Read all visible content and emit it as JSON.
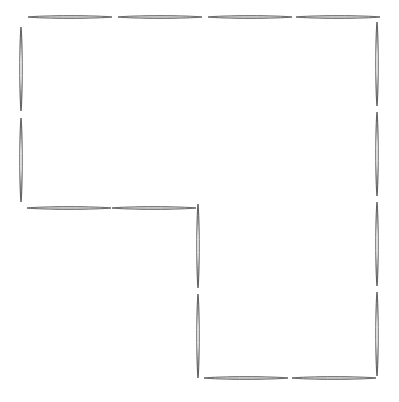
{
  "figure": {
    "background_color": "#ffffff",
    "stick_outline_color": "#4d4d4d",
    "stick_fill_color": "#fdfdfd",
    "stick_highlight_color": "#ffffff",
    "stick_count": 16,
    "shape_description": "L-shaped staircase polygon outlined by matchsticks",
    "canvas": {
      "width": 399,
      "height": 396
    },
    "sticks": [
      {
        "id": "top-1",
        "name": "top-row-stick-1",
        "orientation": "horizontal",
        "x": 28,
        "y": 17,
        "length": 84
      },
      {
        "id": "top-2",
        "name": "top-row-stick-2",
        "orientation": "horizontal",
        "x": 118,
        "y": 17,
        "length": 84
      },
      {
        "id": "top-3",
        "name": "top-row-stick-3",
        "orientation": "horizontal",
        "x": 208,
        "y": 17,
        "length": 84
      },
      {
        "id": "top-4",
        "name": "top-row-stick-4",
        "orientation": "horizontal",
        "x": 296,
        "y": 17,
        "length": 84
      },
      {
        "id": "right-1",
        "name": "right-column-stick-1",
        "orientation": "vertical",
        "x": 377,
        "y": 22,
        "length": 84
      },
      {
        "id": "right-2",
        "name": "right-column-stick-2",
        "orientation": "vertical",
        "x": 377,
        "y": 112,
        "length": 84
      },
      {
        "id": "right-3",
        "name": "right-column-stick-3",
        "orientation": "vertical",
        "x": 377,
        "y": 202,
        "length": 84
      },
      {
        "id": "right-4",
        "name": "right-column-stick-4",
        "orientation": "vertical",
        "x": 377,
        "y": 292,
        "length": 84
      },
      {
        "id": "bottom-1",
        "name": "bottom-row-stick-1",
        "orientation": "horizontal",
        "x": 204,
        "y": 378,
        "length": 84
      },
      {
        "id": "bottom-2",
        "name": "bottom-row-stick-2",
        "orientation": "horizontal",
        "x": 292,
        "y": 378,
        "length": 84
      },
      {
        "id": "mid-vert-1",
        "name": "middle-column-stick-1",
        "orientation": "vertical",
        "x": 198,
        "y": 204,
        "length": 84
      },
      {
        "id": "mid-vert-2",
        "name": "middle-column-stick-2",
        "orientation": "vertical",
        "x": 198,
        "y": 294,
        "length": 84
      },
      {
        "id": "mid-horiz-1",
        "name": "middle-row-stick-1",
        "orientation": "horizontal",
        "x": 27,
        "y": 208,
        "length": 84
      },
      {
        "id": "mid-horiz-2",
        "name": "middle-row-stick-2",
        "orientation": "horizontal",
        "x": 112,
        "y": 208,
        "length": 84
      },
      {
        "id": "left-1",
        "name": "left-column-stick-1",
        "orientation": "vertical",
        "x": 21,
        "y": 27,
        "length": 84
      },
      {
        "id": "left-2",
        "name": "left-column-stick-2",
        "orientation": "vertical",
        "x": 21,
        "y": 118,
        "length": 84
      }
    ]
  },
  "scrollbar": {
    "name": "horizontal-scrollbar",
    "track_color": "#4a4a4a",
    "thumb_color": "#000000",
    "thumb_left": 190,
    "thumb_width": 26
  }
}
